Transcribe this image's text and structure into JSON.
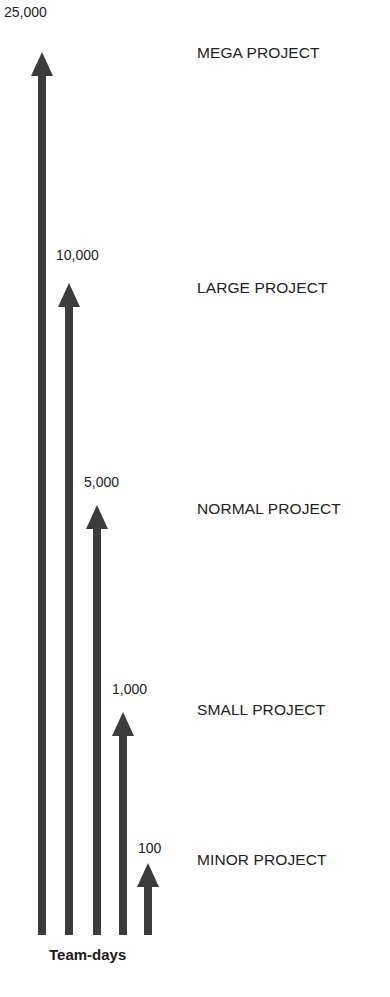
{
  "chart_data": {
    "type": "bar",
    "orientation": "vertical-arrows",
    "title": "",
    "xlabel": "Team-days",
    "ylabel": "",
    "categories": [
      "MEGA PROJECT",
      "LARGE PROJECT",
      "NORMAL PROJECT",
      "SMALL PROJECT",
      "MINOR PROJECT"
    ],
    "values": [
      25000,
      10000,
      5000,
      1000,
      100
    ],
    "value_labels": [
      "25,000",
      "10,000",
      "5,000",
      "1,000",
      "100"
    ],
    "legend": "none",
    "grid": false
  },
  "arrows": [
    {
      "value_label": "25,000",
      "category": "MEGA PROJECT",
      "x": 42,
      "tip_y": 52,
      "label_x": 4,
      "label_y": 4,
      "category_y": 44
    },
    {
      "value_label": "10,000",
      "category": "LARGE PROJECT",
      "x": 69,
      "tip_y": 283,
      "label_x": 56,
      "label_y": 247,
      "category_y": 279
    },
    {
      "value_label": "5,000",
      "category": "NORMAL PROJECT",
      "x": 97,
      "tip_y": 505,
      "label_x": 84,
      "label_y": 474,
      "category_y": 500
    },
    {
      "value_label": "1,000",
      "category": "SMALL PROJECT",
      "x": 123,
      "tip_y": 712,
      "label_x": 112,
      "label_y": 681,
      "category_y": 701
    },
    {
      "value_label": "100",
      "category": "MINOR PROJECT",
      "x": 148,
      "tip_y": 863,
      "label_x": 138,
      "label_y": 840,
      "category_y": 851
    }
  ],
  "axis": {
    "label": "Team-days",
    "base_y": 935
  },
  "colors": {
    "arrow": "#3c3c3c",
    "text": "#222222",
    "background": "#ffffff"
  }
}
